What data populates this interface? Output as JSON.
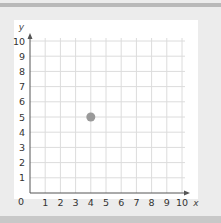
{
  "chart_data": {
    "type": "scatter",
    "title": "",
    "xlabel": "x",
    "ylabel": "y",
    "xlim": [
      0,
      10
    ],
    "ylim": [
      0,
      10
    ],
    "grid": true,
    "x_ticks": [
      "1",
      "2",
      "3",
      "4",
      "5",
      "6",
      "7",
      "8",
      "9",
      "10"
    ],
    "y_ticks": [
      "1",
      "2",
      "3",
      "4",
      "5",
      "6",
      "7",
      "8",
      "9",
      "10"
    ],
    "origin_label": "0",
    "series": [
      {
        "name": "point",
        "points": [
          {
            "x": 4,
            "y": 5
          }
        ]
      }
    ],
    "colors": {
      "point": "#9a9a9a",
      "grid": "#dcdcdc",
      "axis": "#555555"
    }
  }
}
